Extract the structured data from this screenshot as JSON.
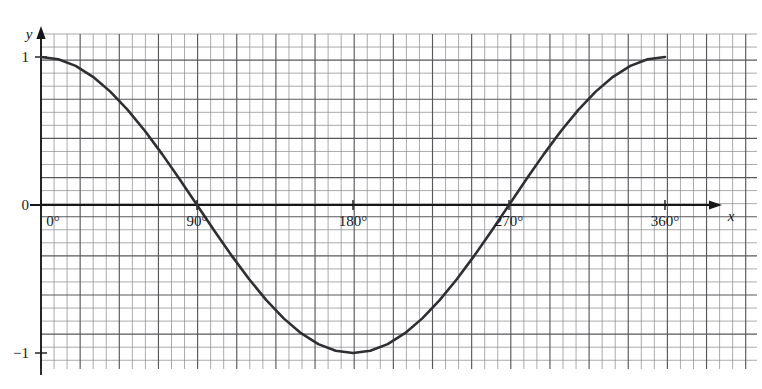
{
  "figure": {
    "background": "#ffffff",
    "grid": {
      "minor_color": "#8f8f92",
      "major_color": "#58585c",
      "minor_spacing_px": 13.05,
      "major_every": 3,
      "left_px": 41,
      "right_px": 757,
      "top_px": 34,
      "bottom_px": 369,
      "show": true
    },
    "axes": {
      "color": "#171717",
      "x_axis_y_px": 205,
      "y_axis_x_px": 41,
      "x_arrow_tip_px": 722,
      "y_arrow_tip_px": 26,
      "x_label": "x",
      "y_label": "y"
    }
  },
  "chart_data": {
    "type": "line",
    "title": "",
    "subtitle": "",
    "xlabel": "x",
    "ylabel": "y",
    "function": "y = cos(x)",
    "grid": true,
    "legend": "none",
    "xlim": [
      0,
      360
    ],
    "ylim": [
      -1,
      1
    ],
    "x_unit": "degrees",
    "x_tick_labels": [
      "0°",
      "90°",
      "180°",
      "270°",
      "360°"
    ],
    "x_ticks": [
      0,
      90,
      180,
      270,
      360
    ],
    "y_tick_labels": [
      "1",
      "0",
      "−1"
    ],
    "y_ticks": [
      1,
      0,
      -1
    ],
    "series": [
      {
        "name": "cosine",
        "color": "#2f2f33",
        "width_px": 2.6,
        "x": [
          0,
          10,
          20,
          30,
          40,
          50,
          60,
          70,
          80,
          90,
          100,
          110,
          120,
          130,
          140,
          150,
          160,
          170,
          180,
          190,
          200,
          210,
          220,
          230,
          240,
          250,
          260,
          270,
          280,
          290,
          300,
          310,
          320,
          330,
          340,
          350,
          360
        ],
        "values": [
          1.0,
          0.985,
          0.94,
          0.866,
          0.766,
          0.643,
          0.5,
          0.342,
          0.174,
          0.0,
          -0.174,
          -0.342,
          -0.5,
          -0.643,
          -0.766,
          -0.866,
          -0.94,
          -0.985,
          -1.0,
          -0.985,
          -0.94,
          -0.866,
          -0.766,
          -0.643,
          -0.5,
          -0.342,
          -0.174,
          0.0,
          0.174,
          0.342,
          0.5,
          0.643,
          0.766,
          0.866,
          0.94,
          0.985,
          1.0
        ]
      }
    ],
    "annotations": [
      {
        "text": "1",
        "x": 0,
        "y": 1,
        "position": "left-of-axis"
      },
      {
        "text": "0",
        "x": 0,
        "y": 0,
        "position": "left-of-axis"
      },
      {
        "text": "−1",
        "x": 0,
        "y": -1,
        "position": "left-of-axis"
      },
      {
        "text": "0°",
        "x": 0,
        "y": 0,
        "position": "below-axis"
      },
      {
        "text": "90°",
        "x": 90,
        "y": 0,
        "position": "below-axis"
      },
      {
        "text": "180°",
        "x": 180,
        "y": 0,
        "position": "below-axis"
      },
      {
        "text": "270°",
        "x": 270,
        "y": 0,
        "position": "below-axis"
      },
      {
        "text": "360°",
        "x": 360,
        "y": 0,
        "position": "below-axis"
      },
      {
        "text": "x",
        "x": 395,
        "y": 0,
        "position": "axis-end"
      },
      {
        "text": "y",
        "x": 0,
        "y": 1.25,
        "position": "axis-end"
      }
    ]
  }
}
